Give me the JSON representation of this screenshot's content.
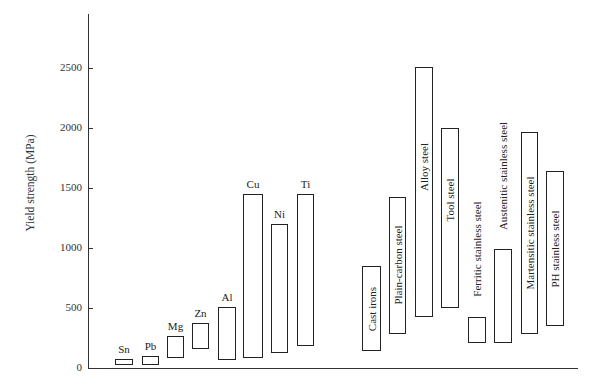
{
  "chart_data": {
    "type": "bar",
    "subtype": "floating-range",
    "title": "",
    "xlabel": "",
    "ylabel": "Yield strength (MPa)",
    "ylim": [
      0,
      2900
    ],
    "yticks": [
      0,
      500,
      1000,
      1500,
      2000,
      2500
    ],
    "ytick_labels": [
      "0",
      "500",
      "1000",
      "1500",
      "2000",
      "2500"
    ],
    "grid": false,
    "legend": null,
    "groups": [
      {
        "name": "Nonferrous",
        "categories": [
          "Sn",
          "Pb",
          "Mg",
          "Zn",
          "Al",
          "Cu",
          "Ni",
          "Ti"
        ]
      },
      {
        "name": "Ferrous",
        "categories": [
          "Cast irons",
          "Plain-carbon steel",
          "Alloy steel",
          "Tool steel",
          "Ferritic stainless steel",
          "Austenitic stainless steel",
          "Martensitic stainless steel",
          "PH stainless steel"
        ]
      }
    ],
    "categories": [
      "Sn",
      "Pb",
      "Mg",
      "Zn",
      "Al",
      "Cu",
      "Ni",
      "Ti",
      "Cast irons",
      "Plain-carbon steel",
      "Alloy steel",
      "Tool steel",
      "Ferritic stainless steel",
      "Austenitic stainless steel",
      "Martensitic stainless steel",
      "PH stainless steel"
    ],
    "series": [
      {
        "name": "min",
        "values": [
          25,
          25,
          85,
          155,
          70,
          80,
          125,
          185,
          140,
          285,
          425,
          500,
          210,
          210,
          285,
          350
        ]
      },
      {
        "name": "max",
        "values": [
          75,
          100,
          265,
          375,
          510,
          1450,
          1200,
          1450,
          850,
          1425,
          2510,
          2000,
          425,
          990,
          1965,
          1640
        ]
      }
    ],
    "bars": [
      {
        "label": "Sn",
        "min": 25,
        "max": 75,
        "label_style": "top",
        "x": 115,
        "w": 18
      },
      {
        "label": "Pb",
        "min": 25,
        "max": 100,
        "label_style": "top",
        "x": 142,
        "w": 17
      },
      {
        "label": "Mg",
        "min": 85,
        "max": 265,
        "label_style": "top",
        "x": 167,
        "w": 17
      },
      {
        "label": "Zn",
        "min": 155,
        "max": 375,
        "label_style": "top",
        "x": 192,
        "w": 17
      },
      {
        "label": "Al",
        "min": 70,
        "max": 510,
        "label_style": "top",
        "x": 218,
        "w": 18
      },
      {
        "label": "Cu",
        "min": 80,
        "max": 1450,
        "label_style": "top",
        "x": 243,
        "w": 20
      },
      {
        "label": "Ni",
        "min": 125,
        "max": 1200,
        "label_style": "top",
        "x": 271,
        "w": 17
      },
      {
        "label": "Ti",
        "min": 185,
        "max": 1450,
        "label_style": "top",
        "x": 297,
        "w": 17
      },
      {
        "label": "Cast irons",
        "min": 140,
        "max": 850,
        "label_style": "inside",
        "x": 362,
        "w": 19
      },
      {
        "label": "Plain-carbon steel",
        "min": 285,
        "max": 1425,
        "label_style": "inside",
        "x": 389,
        "w": 17
      },
      {
        "label": "Alloy steel",
        "min": 425,
        "max": 2510,
        "label_style": "inside-upper",
        "x": 415,
        "w": 18
      },
      {
        "label": "Tool steel",
        "min": 500,
        "max": 2000,
        "label_style": "inside-upper",
        "x": 441,
        "w": 18
      },
      {
        "label": "Ferritic stainless steel",
        "min": 210,
        "max": 425,
        "label_style": "above",
        "x": 468,
        "w": 18
      },
      {
        "label": "Austenitic stainless steel",
        "min": 210,
        "max": 990,
        "label_style": "above",
        "x": 494,
        "w": 18
      },
      {
        "label": "Martensitic stainless steel",
        "min": 285,
        "max": 1965,
        "label_style": "inside",
        "x": 521,
        "w": 17
      },
      {
        "label": "PH stainless steel",
        "min": 350,
        "max": 1640,
        "label_style": "inside",
        "x": 546,
        "w": 18
      }
    ]
  },
  "layout": {
    "y_zero_px": 368,
    "px_per_mpa": 0.12,
    "axis_x_px": 88,
    "axis_top_px": 14,
    "axis_right_px": 578
  }
}
